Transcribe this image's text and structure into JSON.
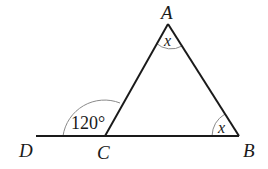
{
  "diagram": {
    "type": "triangle",
    "points": {
      "A": {
        "label": "A",
        "x": 168,
        "y": 24
      },
      "B": {
        "label": "B",
        "x": 239,
        "y": 136
      },
      "C": {
        "label": "C",
        "x": 105,
        "y": 136
      },
      "D": {
        "label": "D",
        "x": 36,
        "y": 136
      }
    },
    "angles": {
      "exterior_C": {
        "label": "120°"
      },
      "A": {
        "label": "x"
      },
      "B": {
        "label": "x"
      }
    },
    "colors": {
      "line": "#1a1a1a",
      "arc": "#7a7a7a"
    }
  }
}
